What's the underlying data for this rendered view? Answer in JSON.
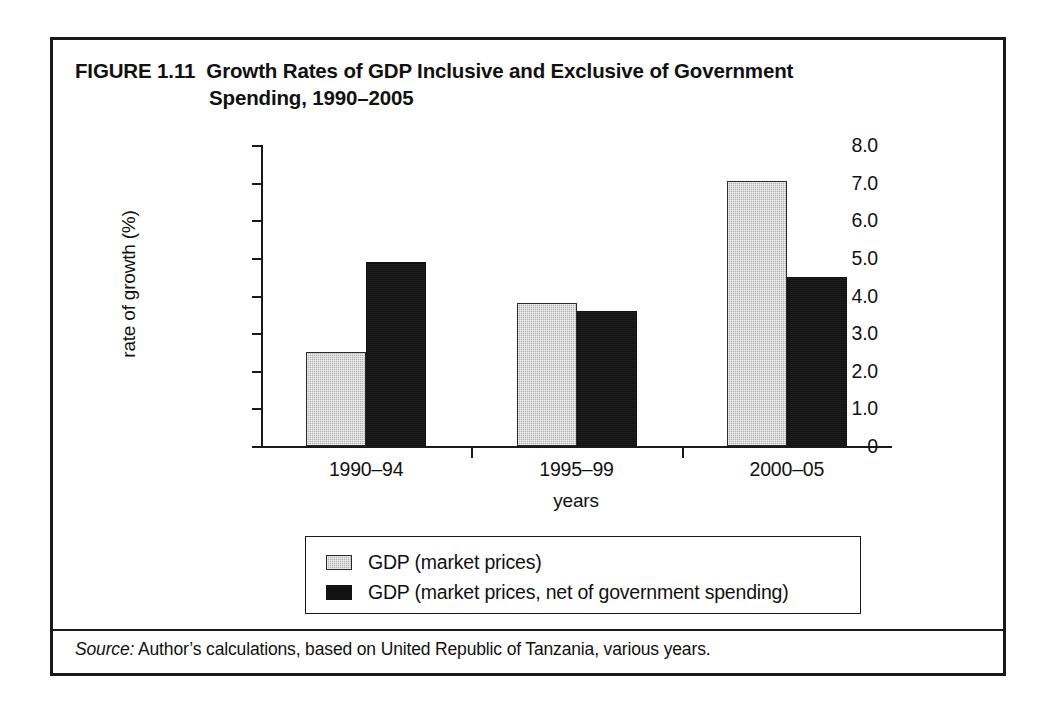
{
  "figure": {
    "label": "FIGURE 1.11",
    "title_line1": "Growth Rates of GDP Inclusive and Exclusive of Government",
    "title_line2": "Spending, 1990–2005"
  },
  "source": {
    "label": "Source:",
    "text": " Author’s calculations, based on United Republic of Tanzania, various years."
  },
  "chart_data": {
    "type": "bar",
    "xlabel": "years",
    "ylabel": "rate of growth (%)",
    "categories": [
      "1990–94",
      "1995–99",
      "2000–05"
    ],
    "series": [
      {
        "name": "GDP (market prices)",
        "color": "#b3b3b3",
        "values": [
          2.5,
          3.8,
          7.05
        ]
      },
      {
        "name": "GDP (market prices, net of government spending)",
        "color": "#121212",
        "values": [
          4.9,
          3.6,
          4.5
        ]
      }
    ],
    "ylim": [
      0,
      8
    ],
    "ytick_values": [
      0,
      1.0,
      2.0,
      3.0,
      4.0,
      5.0,
      6.0,
      7.0,
      8.0
    ],
    "ytick_labels": [
      "0",
      "1.0",
      "2.0",
      "3.0",
      "4.0",
      "5.0",
      "6.0",
      "7.0",
      "8.0"
    ],
    "grid": false,
    "legend_position": "bottom"
  }
}
